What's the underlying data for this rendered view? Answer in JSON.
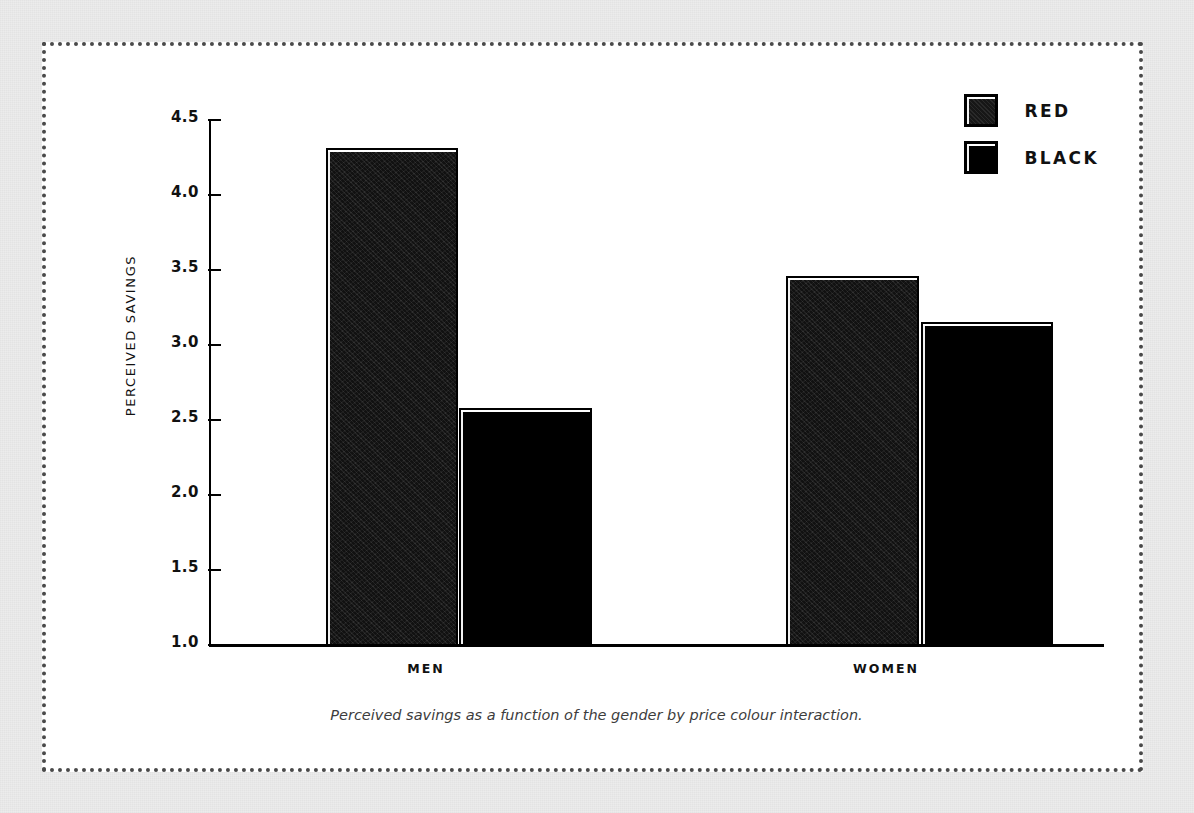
{
  "figure": {
    "caption": "Perceived savings as a function of the gender by price colour interaction.",
    "background_color": "#ececec",
    "panel_color": "#ffffff",
    "border_color": "#4a4a4a"
  },
  "legend": {
    "position": "top-right",
    "entries": [
      {
        "label": "RED",
        "color": "#191919",
        "swatch_name": "legend-swatch-red"
      },
      {
        "label": "BLACK",
        "color": "#000000",
        "swatch_name": "legend-swatch-black"
      }
    ]
  },
  "axes": {
    "y_label": "PERCEIVED SAVINGS",
    "y_ticks": [
      "4.5",
      "4.0",
      "3.5",
      "3.0",
      "2.5",
      "2.0",
      "1.5",
      "1.0"
    ],
    "x_ticks": [
      "MEN",
      "WOMEN"
    ]
  },
  "chart_data": {
    "type": "bar",
    "title": "",
    "subtitle": "",
    "xlabel": "",
    "ylabel": "PERCEIVED SAVINGS",
    "categories": [
      "MEN",
      "WOMEN"
    ],
    "series": [
      {
        "name": "RED",
        "color": "#191919",
        "values": [
          4.31,
          3.46
        ]
      },
      {
        "name": "BLACK",
        "color": "#000000",
        "values": [
          2.58,
          3.15
        ]
      }
    ],
    "ylim": [
      1.0,
      4.5
    ],
    "yticks": [
      1.0,
      1.5,
      2.0,
      2.5,
      3.0,
      3.5,
      4.0,
      4.5
    ],
    "grid": false,
    "legend_position": "top-right",
    "annotations": [
      "Perceived savings as a function of the gender by price colour interaction."
    ]
  }
}
